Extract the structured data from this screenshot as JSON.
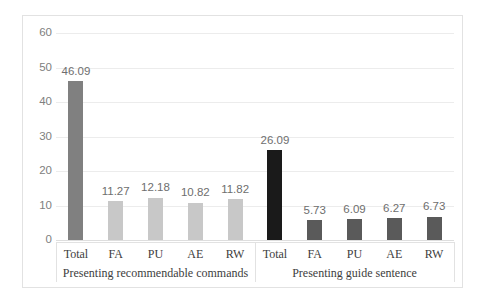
{
  "chart_data": {
    "type": "bar",
    "title": "",
    "subtitle": "",
    "xlabel": "",
    "ylabel": "",
    "ylim": [
      0,
      60
    ],
    "ytick_labels": [
      "60",
      "50",
      "40",
      "30",
      "20",
      "10",
      "0"
    ],
    "ytick_values": [
      60,
      50,
      40,
      30,
      20,
      10,
      0
    ],
    "grid": true,
    "legend": "none",
    "categories": [
      "Total",
      "FA",
      "PU",
      "AE",
      "RW"
    ],
    "groups": [
      {
        "label": "Presenting recommendable commands",
        "categories": [
          "Total",
          "FA",
          "PU",
          "AE",
          "RW"
        ],
        "values": [
          46.09,
          11.27,
          12.18,
          10.82,
          11.82
        ],
        "value_labels": [
          "46.09",
          "11.27",
          "12.18",
          "10.82",
          "11.82"
        ],
        "bar_colors": [
          "#808080",
          "#c8c8c8",
          "#c8c8c8",
          "#c8c8c8",
          "#c8c8c8"
        ]
      },
      {
        "label": "Presenting guide sentence",
        "categories": [
          "Total",
          "FA",
          "PU",
          "AE",
          "RW"
        ],
        "values": [
          26.09,
          5.73,
          6.09,
          6.27,
          6.73
        ],
        "value_labels": [
          "26.09",
          "5.73",
          "6.09",
          "6.27",
          "6.73"
        ],
        "bar_colors": [
          "#1a1a1a",
          "#5a5a5a",
          "#5a5a5a",
          "#5a5a5a",
          "#5a5a5a"
        ]
      }
    ],
    "colors": {
      "group1_total": "#808080",
      "group1_bars": "#c8c8c8",
      "group2_total": "#1a1a1a",
      "group2_bars": "#5a5a5a",
      "gridline": "#ececec",
      "frame": "#e2e2e2",
      "tick_text": "#808080",
      "label_text": "#3d3d3d",
      "value_text": "#6e6e6e",
      "background": "#ffffff"
    }
  }
}
